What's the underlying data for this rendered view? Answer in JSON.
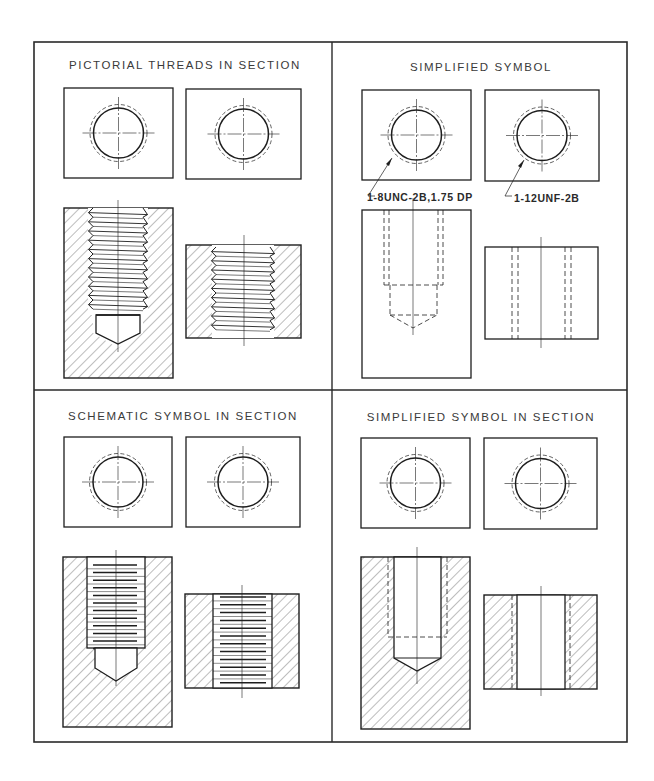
{
  "figure": {
    "panels": [
      {
        "id": "pictorial",
        "title": "PICTORIAL THREADS IN SECTION",
        "views": [
          "top-view-blind-hole",
          "top-view-through-hole",
          "section-blind-hole",
          "section-through-hole"
        ],
        "style": "pictorial"
      },
      {
        "id": "simplified",
        "title": "SIMPLIFIED SYMBOL",
        "callouts": [
          {
            "label": "1-8UNC-2B,1.75 DP",
            "target": "blind-hole"
          },
          {
            "label": "1-12UNF-2B",
            "target": "through-hole"
          }
        ],
        "style": "simplified"
      },
      {
        "id": "schematic-section",
        "title": "SCHEMATIC SYMBOL IN SECTION",
        "style": "schematic"
      },
      {
        "id": "simplified-section",
        "title": "SIMPLIFIED SYMBOL IN SECTION",
        "style": "simplified-section"
      }
    ],
    "colors": {
      "line": "#1e1e1e",
      "hatch": "#555555",
      "text": "#3a3a3a",
      "background": "#ffffff"
    }
  }
}
